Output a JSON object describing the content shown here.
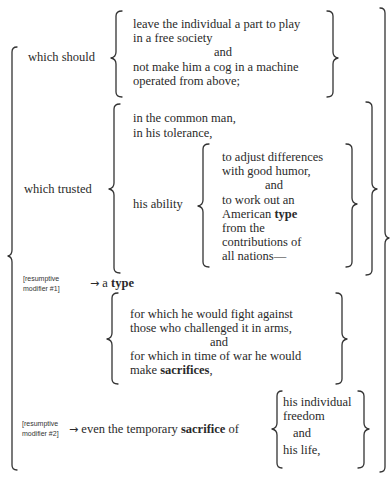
{
  "diagram": {
    "which_should": {
      "label": "which should",
      "items": [
        "leave the individual a part to play",
        "in a free society",
        "and",
        "not make him a cog in a machine",
        "operated from above;"
      ]
    },
    "which_trusted": {
      "label": "which trusted",
      "items": [
        "in the common man,",
        "in his tolerance,"
      ],
      "his_ability": {
        "label": "his ability",
        "items": [
          "to adjust differences",
          "with good humor,",
          "and",
          "to work out an",
          "American ",
          "type",
          "from the",
          "contributions of",
          "all nations—"
        ]
      }
    },
    "resumptive_1": {
      "note_line1": "[resumptive",
      "note_line2": "modifier #1]",
      "arrow": "→",
      "text_prefix": "a ",
      "text_bold": "type",
      "clauses": [
        "for which he would fight against",
        "those who challenged it in arms,",
        "and",
        "for which in time of war he would",
        "make ",
        "sacrifices",
        ","
      ]
    },
    "resumptive_2": {
      "note_line1": "[resumptive",
      "note_line2": "modifier #2]",
      "arrow": "→",
      "text_prefix": "even the temporary ",
      "text_bold": "sacrifice",
      "text_suffix": " of",
      "items": [
        "his individual",
        "freedom",
        "and",
        "his life,"
      ]
    }
  }
}
